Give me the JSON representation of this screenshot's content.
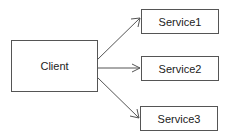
{
  "diagram": {
    "nodes": [
      {
        "id": "client",
        "label": "Client",
        "x": 11,
        "y": 40,
        "w": 87,
        "h": 52
      },
      {
        "id": "service1",
        "label": "Service1",
        "x": 141,
        "y": 9,
        "w": 78,
        "h": 25
      },
      {
        "id": "service2",
        "label": "Service2",
        "x": 141,
        "y": 56,
        "w": 78,
        "h": 25
      },
      {
        "id": "service3",
        "label": "Service3",
        "x": 140,
        "y": 106,
        "w": 78,
        "h": 25
      }
    ],
    "edges": [
      {
        "from": "client",
        "to": "service1",
        "style": "open-arrow"
      },
      {
        "from": "client",
        "to": "service2",
        "style": "open-arrow"
      },
      {
        "from": "client",
        "to": "service3",
        "style": "open-arrow"
      }
    ],
    "colors": {
      "stroke": "#555555",
      "text": "#222222",
      "background": "#ffffff"
    }
  }
}
